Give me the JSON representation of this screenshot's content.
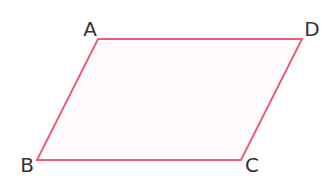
{
  "diagram": {
    "type": "parallelogram",
    "stroke_color": "#e8607a",
    "fill_color": "#fffafb",
    "vertices": [
      {
        "label": "A",
        "x": 98,
        "y": 39,
        "label_x": 90,
        "label_y": 36
      },
      {
        "label": "D",
        "x": 302,
        "y": 39,
        "label_x": 312,
        "label_y": 36
      },
      {
        "label": "C",
        "x": 241,
        "y": 160,
        "label_x": 252,
        "label_y": 172
      },
      {
        "label": "B",
        "x": 37,
        "y": 160,
        "label_x": 27,
        "label_y": 172
      }
    ]
  }
}
